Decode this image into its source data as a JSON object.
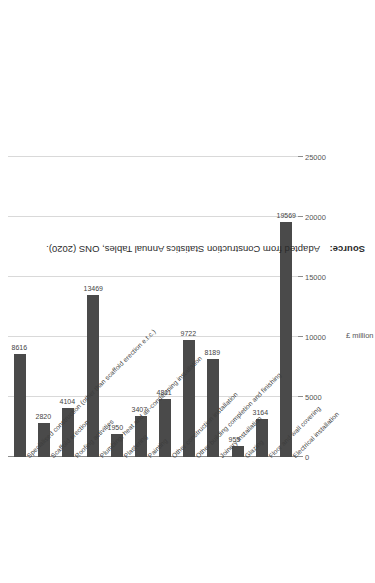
{
  "chart_data": {
    "type": "bar",
    "orientation": "horizontal",
    "title": "",
    "xlabel": "£ million",
    "ylabel": "",
    "xlim": [
      0,
      25000
    ],
    "xticks": [
      "0",
      "5000",
      "10000",
      "15000",
      "20000",
      "25000"
    ],
    "xtick_values": [
      0,
      5000,
      10000,
      15000,
      20000,
      25000
    ],
    "grid": true,
    "legend": "none",
    "bar_color": "#4a4a4a",
    "categories": [
      "Electrical installation",
      "Floor and wall covering",
      "Glazing",
      "Joinery installation",
      "Other building completion and finishing",
      "Other construction installation",
      "Painting",
      "Plastering",
      "Plumbing, heat and air-conditioning installation",
      "Roofing activities",
      "Scaffold erection",
      "Specialised construction (other than scaffold erection e.t.c.)"
    ],
    "values": [
      19569,
      3164,
      955,
      8189,
      9722,
      4811,
      3407,
      1950,
      13469,
      4104,
      2820,
      8616
    ],
    "data_labels": [
      "19569",
      "3164",
      "955",
      "8189",
      "9722",
      "4811",
      "3407",
      "1950",
      "13469",
      "4104",
      "2820",
      "8616"
    ]
  },
  "source": {
    "label": "Source:",
    "text": "Adapted from Construction Statistics Annual Tables, ONS (2020)."
  }
}
